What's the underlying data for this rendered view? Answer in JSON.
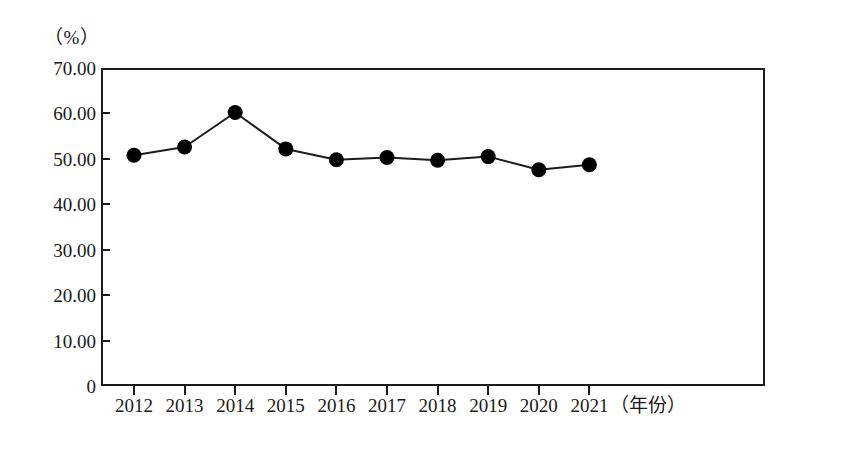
{
  "chart_data": {
    "type": "line",
    "title": "",
    "subtitle": "",
    "unit_label": "（%）",
    "xlabel": "（年份）",
    "ylabel": "",
    "categories": [
      "2012",
      "2013",
      "2014",
      "2015",
      "2016",
      "2017",
      "2018",
      "2019",
      "2020",
      "2021"
    ],
    "series": [
      {
        "name": "",
        "values": [
          50.8,
          52.6,
          60.2,
          52.2,
          49.8,
          50.3,
          49.7,
          50.5,
          47.6,
          48.7
        ]
      }
    ],
    "ylim": [
      0,
      70
    ],
    "ytick_labels": [
      "70.00",
      "60.00",
      "50.00",
      "40.00",
      "30.00",
      "20.00",
      "10.00",
      "0"
    ],
    "ytick_values": [
      70,
      60,
      50,
      40,
      30,
      20,
      10,
      0
    ],
    "grid": false,
    "legend": "none",
    "marker": "filled-circle",
    "marker_color": "#000000",
    "line_color": "#1c1c1c",
    "frame_color": "#1c1c1c",
    "background": "#ffffff"
  },
  "axes": {
    "y_unit_caption": "（%）",
    "x_axis_caption": "（年份）"
  }
}
